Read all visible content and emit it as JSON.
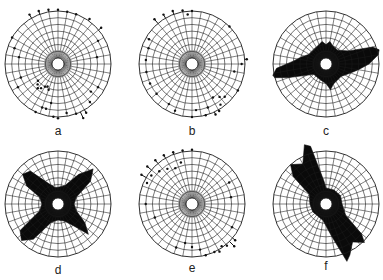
{
  "chart_data": [
    {
      "type": "polar_scatter",
      "panel": "a",
      "label": "a",
      "center": [
        58,
        64
      ],
      "rings": 7,
      "spokes_deg": 10,
      "style": "dots",
      "points_deg_radius": [
        [
          330,
          7.6
        ],
        [
          340,
          7.5
        ],
        [
          350,
          7.3
        ],
        [
          0,
          7.2
        ],
        [
          10,
          7.0
        ],
        [
          20,
          7.0
        ],
        [
          35,
          7.3
        ],
        [
          50,
          7.5
        ],
        [
          300,
          7.0
        ],
        [
          290,
          6.0
        ],
        [
          280,
          5.0
        ],
        [
          60,
          6.0
        ],
        [
          80,
          5.0
        ],
        [
          210,
          3.0
        ],
        [
          215,
          3.5
        ],
        [
          220,
          3.8
        ],
        [
          225,
          3.4
        ],
        [
          205,
          2.8
        ],
        [
          200,
          3.2
        ],
        [
          230,
          3.0
        ],
        [
          190,
          5.0
        ],
        [
          195,
          6.0
        ],
        [
          185,
          7.0
        ],
        [
          180,
          7.2
        ],
        [
          170,
          6.5
        ],
        [
          160,
          7.0
        ],
        [
          150,
          7.5
        ],
        [
          155,
          8.0
        ],
        [
          240,
          6.0
        ],
        [
          250,
          5.0
        ],
        [
          120,
          6.0
        ],
        [
          130,
          5.5
        ],
        [
          140,
          6.5
        ],
        [
          200,
          6.0
        ],
        [
          205,
          7.0
        ]
      ]
    },
    {
      "type": "polar_scatter",
      "panel": "b",
      "label": "b",
      "center": [
        192,
        64
      ],
      "rings": 7,
      "spokes_deg": 10,
      "style": "dots",
      "points_deg_radius": [
        [
          320,
          7.8
        ],
        [
          330,
          7.6
        ],
        [
          340,
          7.5
        ],
        [
          350,
          7.2
        ],
        [
          355,
          6.5
        ],
        [
          0,
          7.0
        ],
        [
          45,
          7.0
        ],
        [
          300,
          6.5
        ],
        [
          290,
          6.0
        ],
        [
          275,
          6.0
        ],
        [
          260,
          6.0
        ],
        [
          245,
          6.0
        ],
        [
          230,
          6.0
        ],
        [
          85,
          7.3
        ],
        [
          90,
          6.5
        ],
        [
          100,
          5.5
        ],
        [
          145,
          6.5
        ],
        [
          150,
          7.2
        ],
        [
          155,
          7.4
        ],
        [
          140,
          5.5
        ],
        [
          148,
          5.0
        ],
        [
          135,
          6.0
        ],
        [
          160,
          6.0
        ],
        [
          165,
          7.0
        ],
        [
          175,
          6.0
        ],
        [
          180,
          7.0
        ],
        [
          200,
          6.5
        ],
        [
          210,
          6.0
        ],
        [
          120,
          7.0
        ]
      ]
    },
    {
      "type": "polar_area",
      "panel": "c",
      "label": "c",
      "center": [
        326,
        64
      ],
      "rings": 7,
      "spokes_deg": 10,
      "style": "filled",
      "polygon_deg_radius": [
        [
          0,
          2.0
        ],
        [
          10,
          2.5
        ],
        [
          20,
          2.0
        ],
        [
          40,
          1.8
        ],
        [
          60,
          3.0
        ],
        [
          70,
          6.5
        ],
        [
          75,
          7.3
        ],
        [
          80,
          7.0
        ],
        [
          90,
          5.5
        ],
        [
          100,
          4.0
        ],
        [
          110,
          3.0
        ],
        [
          130,
          2.0
        ],
        [
          160,
          2.3
        ],
        [
          170,
          3.0
        ],
        [
          180,
          2.0
        ],
        [
          200,
          1.6
        ],
        [
          230,
          1.5
        ],
        [
          250,
          5.0
        ],
        [
          255,
          7.0
        ],
        [
          258,
          7.2
        ],
        [
          265,
          6.5
        ],
        [
          275,
          4.0
        ],
        [
          285,
          3.0
        ],
        [
          300,
          2.0
        ],
        [
          330,
          2.0
        ],
        [
          350,
          2.5
        ]
      ]
    },
    {
      "type": "polar_area",
      "panel": "d",
      "label": "d",
      "center": [
        58,
        204
      ],
      "rings": 7,
      "spokes_deg": 10,
      "style": "filled",
      "polygon_deg_radius": [
        [
          0,
          1.6
        ],
        [
          20,
          2.0
        ],
        [
          35,
          4.5
        ],
        [
          45,
          6.5
        ],
        [
          55,
          5.0
        ],
        [
          70,
          2.0
        ],
        [
          90,
          1.5
        ],
        [
          110,
          2.0
        ],
        [
          125,
          4.0
        ],
        [
          135,
          5.5
        ],
        [
          145,
          3.0
        ],
        [
          160,
          1.8
        ],
        [
          180,
          1.5
        ],
        [
          200,
          2.0
        ],
        [
          215,
          5.5
        ],
        [
          225,
          6.8
        ],
        [
          235,
          6.0
        ],
        [
          250,
          2.0
        ],
        [
          270,
          1.5
        ],
        [
          290,
          2.0
        ],
        [
          300,
          4.5
        ],
        [
          310,
          6.0
        ],
        [
          320,
          5.5
        ],
        [
          335,
          2.5
        ],
        [
          350,
          1.6
        ]
      ]
    },
    {
      "type": "polar_scatter",
      "panel": "e",
      "label": "e",
      "center": [
        192,
        204
      ],
      "rings": 7,
      "spokes_deg": 10,
      "style": "dots",
      "points_deg_radius": [
        [
          300,
          7.8
        ],
        [
          310,
          7.8
        ],
        [
          320,
          7.6
        ],
        [
          330,
          7.5
        ],
        [
          340,
          7.3
        ],
        [
          350,
          7.2
        ],
        [
          0,
          7.2
        ],
        [
          295,
          6.5
        ],
        [
          305,
          6.5
        ],
        [
          315,
          6.0
        ],
        [
          325,
          5.5
        ],
        [
          335,
          5.0
        ],
        [
          345,
          5.5
        ],
        [
          270,
          6.0
        ],
        [
          250,
          5.0
        ],
        [
          60,
          5.5
        ],
        [
          80,
          5.0
        ],
        [
          130,
          7.5
        ],
        [
          135,
          8.0
        ],
        [
          140,
          7.2
        ],
        [
          145,
          6.8
        ],
        [
          150,
          7.3
        ],
        [
          155,
          7.0
        ],
        [
          170,
          6.0
        ],
        [
          180,
          5.5
        ],
        [
          190,
          5.0
        ],
        [
          200,
          6.0
        ],
        [
          120,
          6.0
        ],
        [
          165,
          7.0
        ]
      ]
    },
    {
      "type": "polar_area",
      "panel": "f",
      "label": "f",
      "center": [
        326,
        204
      ],
      "rings": 7,
      "spokes_deg": 10,
      "style": "filled",
      "polygon_deg_radius": [
        [
          0,
          1.5
        ],
        [
          30,
          1.5
        ],
        [
          60,
          1.6
        ],
        [
          90,
          1.5
        ],
        [
          120,
          2.5
        ],
        [
          130,
          6.0
        ],
        [
          135,
          7.2
        ],
        [
          145,
          6.0
        ],
        [
          155,
          7.5
        ],
        [
          160,
          8.2
        ],
        [
          170,
          4.0
        ],
        [
          190,
          1.6
        ],
        [
          240,
          1.4
        ],
        [
          270,
          1.5
        ],
        [
          300,
          2.0
        ],
        [
          310,
          5.5
        ],
        [
          318,
          7.0
        ],
        [
          330,
          6.0
        ],
        [
          340,
          8.5
        ],
        [
          345,
          8.0
        ],
        [
          355,
          2.5
        ]
      ]
    }
  ],
  "figure": {
    "panels": [
      {
        "id": "a",
        "label": "a",
        "label_pos": [
          58,
          125
        ]
      },
      {
        "id": "b",
        "label": "b",
        "label_pos": [
          192,
          125
        ]
      },
      {
        "id": "c",
        "label": "c",
        "label_pos": [
          326,
          125
        ]
      },
      {
        "id": "d",
        "label": "d",
        "label_pos": [
          58,
          264
        ]
      },
      {
        "id": "e",
        "label": "e",
        "label_pos": [
          192,
          262
        ]
      },
      {
        "id": "f",
        "label": "f",
        "label_pos": [
          326,
          260
        ]
      }
    ],
    "outer_radius": 53,
    "inner_radius": 6,
    "ring_count": 7,
    "spoke_step_deg": 10,
    "grid_color": "#1a1a1a",
    "fill_color": "#0a0a0a",
    "dot_color": "#111111"
  }
}
